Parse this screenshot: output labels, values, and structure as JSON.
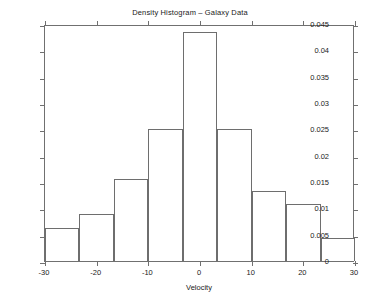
{
  "chart_data": {
    "type": "bar",
    "title": "Density Histogram – Galaxy Data",
    "xlabel": "Velocity",
    "ylabel": "",
    "xlim": [
      -30,
      30
    ],
    "ylim": [
      0,
      0.045
    ],
    "grid": false,
    "legend": null,
    "bin_width": 6.667,
    "bin_edges": [
      -30,
      -23.333,
      -16.667,
      -10,
      -3.333,
      3.333,
      10,
      16.667,
      23.333,
      30
    ],
    "categories": [
      "-30 to -23.3",
      "-23.3 to -16.7",
      "-16.7 to -10",
      "-10 to -3.3",
      "-3.3 to 3.3",
      "3.3 to 10",
      "10 to 16.7",
      "16.7 to 23.3",
      "23.3 to 30"
    ],
    "values": [
      0.0062,
      0.009,
      0.0156,
      0.025,
      0.0435,
      0.025,
      0.0133,
      0.0109,
      0.0044
    ],
    "xticks": [
      -30,
      -20,
      -10,
      0,
      10,
      20,
      30
    ],
    "xtick_labels": [
      "-30",
      "-20",
      "-10",
      "0",
      "10",
      "20",
      "30"
    ],
    "yticks": [
      0,
      0.005,
      0.01,
      0.015,
      0.02,
      0.025,
      0.03,
      0.035,
      0.04,
      0.045
    ],
    "ytick_labels": [
      "0",
      "0.005",
      "0.01",
      "0.015",
      "0.02",
      "0.025",
      "0.03",
      "0.035",
      "0.04",
      "0.045"
    ],
    "bar_face_color": "#ffffff",
    "bar_edge_color": "#6e6e6e",
    "axis_color": "#707070",
    "text_color": "#1a1a1a",
    "background_color": "#ffffff"
  }
}
